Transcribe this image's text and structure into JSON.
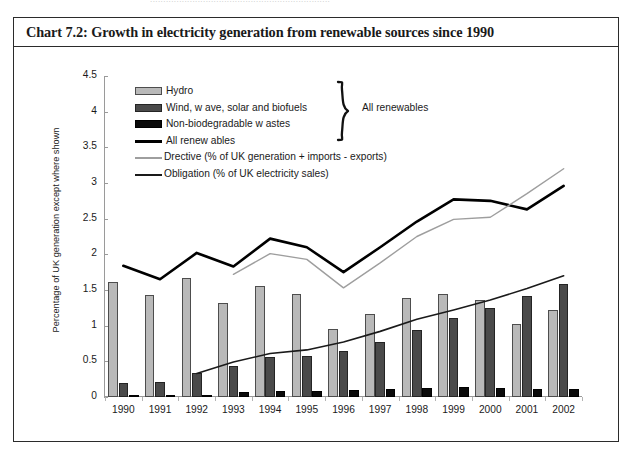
{
  "page": {
    "bleed_text": "...................................................................."
  },
  "chart_title": "Chart 7.2: Growth in electricity generation from renewable sources since 1990",
  "brace_label": "All renewables",
  "legend": [
    {
      "key": "hydro",
      "label": "Hydro",
      "swatch": "sw-hydro",
      "color": "#b9b9b9"
    },
    {
      "key": "wind",
      "label": "Wind, w ave, solar and biofuels",
      "swatch": "sw-wind",
      "color": "#4a4a4a"
    },
    {
      "key": "waste",
      "label": "Non-biodegradable w astes",
      "swatch": "sw-waste",
      "color": "#0a0a0a"
    },
    {
      "key": "allren",
      "label": "All renew ables",
      "swatch": "sw-all",
      "color": "#000000"
    },
    {
      "key": "directive",
      "label": "Drective (% of UK generation + imports - exports)",
      "swatch": "sw-directive",
      "color": "#9e9e9e"
    },
    {
      "key": "obligation",
      "label": "Obligation (% of UK electricity sales)",
      "swatch": "sw-obligation",
      "color": "#1a1a1a"
    }
  ],
  "chart_data": {
    "type": "bar",
    "title": "Chart 7.2: Growth in electricity generation from renewable sources since 1990",
    "xlabel": "",
    "ylabel": "Percentage of UK generation except where shown",
    "ylim": [
      0,
      4.5
    ],
    "ytick_step": 0.5,
    "yticks": [
      "4.5",
      "4",
      "3.5",
      "3",
      "2.5",
      "2",
      "1.5",
      "1",
      "0.5",
      "0"
    ],
    "grid": false,
    "legend_position": "inside-top-left",
    "categories": [
      "1990",
      "1991",
      "1992",
      "1993",
      "1994",
      "1995",
      "1996",
      "1997",
      "1998",
      "1999",
      "2000",
      "2001",
      "2002"
    ],
    "series": [
      {
        "name": "Hydro",
        "kind": "bar",
        "color": "#b9b9b9",
        "values": [
          1.61,
          1.43,
          1.67,
          1.32,
          1.55,
          1.44,
          0.96,
          1.17,
          1.39,
          1.45,
          1.36,
          1.03,
          1.22
        ]
      },
      {
        "name": "Wind, w ave, solar and biofuels",
        "kind": "bar",
        "color": "#4a4a4a",
        "values": [
          0.19,
          0.21,
          0.33,
          0.44,
          0.56,
          0.58,
          0.64,
          0.77,
          0.94,
          1.11,
          1.25,
          1.41,
          1.58
        ]
      },
      {
        "name": "Non-biodegradable w astes",
        "kind": "bar",
        "color": "#0a0a0a",
        "values": [
          0.0,
          0.0,
          0.02,
          0.07,
          0.09,
          0.09,
          0.1,
          0.11,
          0.13,
          0.14,
          0.13,
          0.11,
          0.11
        ]
      },
      {
        "name": "All renew ables",
        "kind": "line",
        "color": "#000000",
        "width": 2.6,
        "x": [
          "1990",
          "1991",
          "1992",
          "1993",
          "1994",
          "1995",
          "1996",
          "1997",
          "1998",
          "1999",
          "2000",
          "2001",
          "2002"
        ],
        "values": [
          1.84,
          1.65,
          2.02,
          1.83,
          2.22,
          2.1,
          1.75,
          2.1,
          2.46,
          2.77,
          2.75,
          2.63,
          2.96
        ]
      },
      {
        "name": "Drective (% of UK generation + imports - exports)",
        "kind": "line",
        "color": "#9e9e9e",
        "width": 1.4,
        "x": [
          "1993",
          "1994",
          "1995",
          "1996",
          "1997",
          "1998",
          "1999",
          "2000",
          "2001",
          "2002"
        ],
        "values": [
          1.72,
          2.01,
          1.93,
          1.53,
          1.88,
          2.25,
          2.49,
          2.52,
          2.85,
          3.2
        ]
      },
      {
        "name": "Obligation (% of UK electricity sales)",
        "kind": "line",
        "color": "#1a1a1a",
        "width": 1.6,
        "x": [
          "1992",
          "1993",
          "1994",
          "1995",
          "1996",
          "1997",
          "1998",
          "1999",
          "2000",
          "2001",
          "2002"
        ],
        "values": [
          0.33,
          0.49,
          0.61,
          0.66,
          0.77,
          0.92,
          1.09,
          1.22,
          1.36,
          1.52,
          1.7
        ]
      }
    ]
  }
}
